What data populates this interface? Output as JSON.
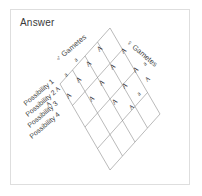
{
  "card": {
    "title": "Answer"
  },
  "diagram": {
    "type": "punnett-square-isometric",
    "axes": [
      {
        "symbol": "♂",
        "label": "Gametes",
        "name": "male-gametes-axis"
      },
      {
        "symbol": "♀",
        "label": "Gametes",
        "name": "female-gametes-axis"
      }
    ],
    "row_labels": [
      "Possibility 1",
      "Possibility 2",
      "Possibility 3",
      "Possibility 4"
    ],
    "male_gamete_alleles": [
      "a",
      "a",
      "A",
      "A"
    ],
    "female_gamete_alleles": [
      "a",
      "A",
      "a",
      "A"
    ],
    "cells": [
      [
        "A",
        "A",
        "A"
      ],
      [
        "A",
        "A",
        "A"
      ],
      [
        "A",
        "A",
        "A"
      ],
      [
        "A",
        "A",
        "A"
      ]
    ],
    "colors": {
      "line": "#8c8c8c",
      "text": "#2b2b2b",
      "frame": "#dedede",
      "background": "#ffffff"
    }
  }
}
